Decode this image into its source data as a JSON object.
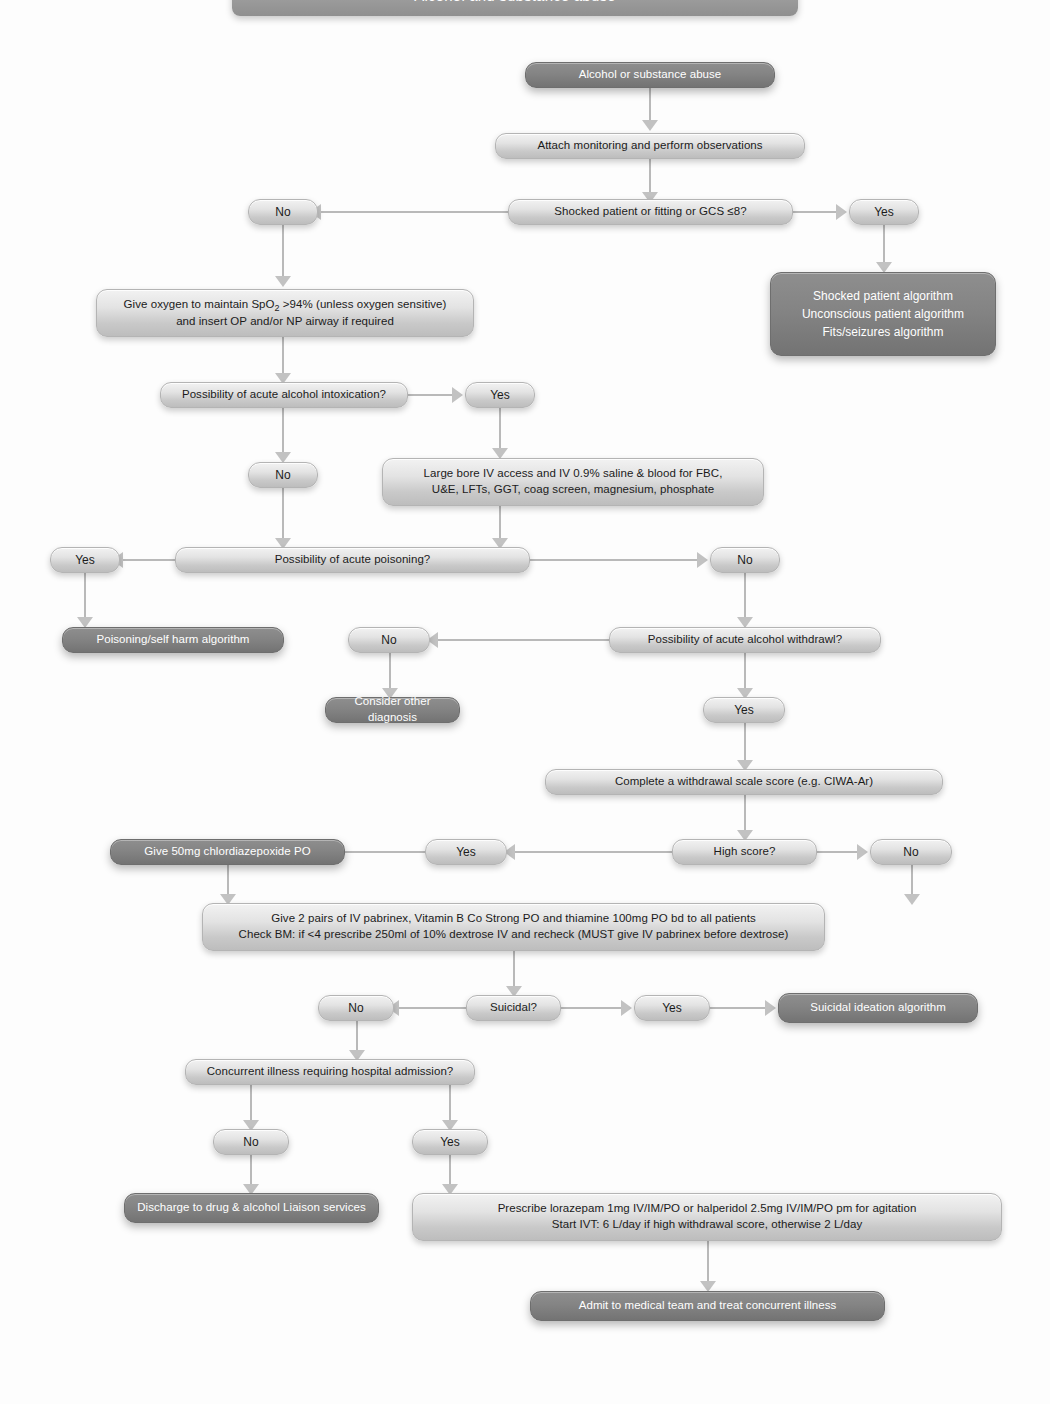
{
  "header": {
    "title": "Alcohol and substance abuse"
  },
  "nodes": {
    "start": "Alcohol or substance abuse",
    "monitoring": "Attach monitoring and perform observations",
    "shocked_q": "Shocked patient or fitting or GCS ≤8?",
    "shocked_no": "No",
    "shocked_yes": "Yes",
    "shocked_algorithms": {
      "line1": "Shocked patient algorithm",
      "line2": "Unconscious patient algorithm",
      "line3": "Fits/seizures algorithm"
    },
    "oxygen": {
      "line1_a": "Give oxygen to maintain SpO",
      "line1_sub": "2",
      "line1_b": " >94% (unless oxygen sensitive)",
      "line2": "and insert OP and/or NP airway if required"
    },
    "intox_q": "Possibility of acute alcohol intoxication?",
    "intox_yes": "Yes",
    "intox_no": "No",
    "iv_access": {
      "line1": "Large bore IV access and IV 0.9% saline & blood for FBC,",
      "line2": "U&E, LFTs, GGT, coag screen, magnesium, phosphate"
    },
    "poisoning_q": "Possibility of acute poisoning?",
    "poisoning_yes": "Yes",
    "poisoning_no": "No",
    "poisoning_algorithm": "Poisoning/self harm algorithm",
    "withdrawal_q": "Possibility of acute alcohol withdrawl?",
    "withdrawal_no": "No",
    "withdrawal_yes": "Yes",
    "other_diagnosis": "Consider other diagnosis",
    "ciwa": "Complete a withdrawal scale score (e.g. CIWA-Ar)",
    "high_score_q": "High score?",
    "high_score_yes": "Yes",
    "high_score_no": "No",
    "chlordiazepoxide": "Give 50mg chlordiazepoxide PO",
    "pabrinex": {
      "line1": "Give 2 pairs of IV pabrinex, Vitamin B Co Strong PO and thiamine 100mg PO bd to all patients",
      "line2": "Check BM: if <4 prescribe 250ml of 10% dextrose IV and recheck (MUST give IV pabrinex before dextrose)"
    },
    "suicidal_q": "Suicidal?",
    "suicidal_no": "No",
    "suicidal_yes": "Yes",
    "suicidal_algorithm": "Suicidal ideation algorithm",
    "concurrent_q": "Concurrent illness requiring hospital admission?",
    "concurrent_no": "No",
    "concurrent_yes": "Yes",
    "discharge": "Discharge to drug & alcohol Liaison services",
    "prescribe": {
      "line1": "Prescribe lorazepam 1mg IV/IM/PO or halperidol 2.5mg IV/IM/PO pm for agitation",
      "line2": "Start IVT: 6 L/day if high withdrawal score, otherwise 2 L/day"
    },
    "admit": "Admit to medical team and treat concurrent illness"
  },
  "colors": {
    "light_node": "#e0e0e0",
    "dark_node": "#7d7d7d",
    "connector": "#bcbcbc",
    "page_background": "#fdfdfd",
    "text_dark": "#1b1b1b",
    "text_light": "#ffffff"
  }
}
